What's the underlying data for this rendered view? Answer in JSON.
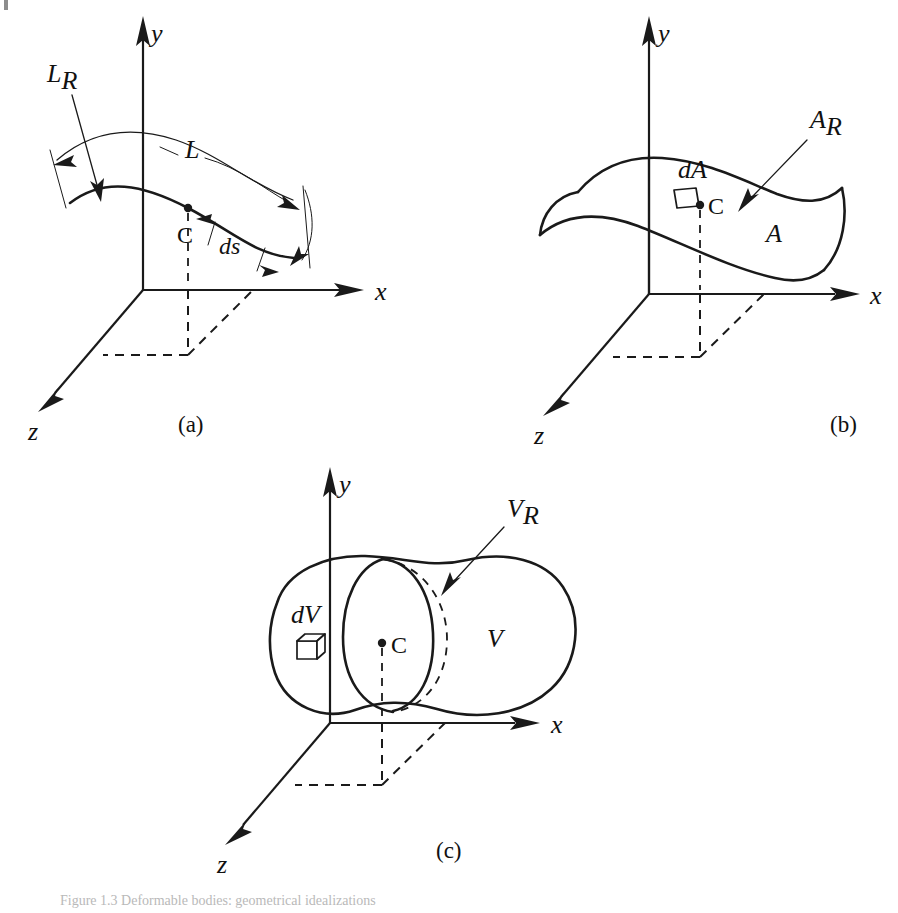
{
  "figure": {
    "panels": [
      {
        "id": "a",
        "caption": "(a)",
        "kind": "line",
        "axes": {
          "y": "y",
          "x": "x",
          "z": "z",
          "origin": "O"
        },
        "labels": {
          "reference_config": "L",
          "reference_sub": "R",
          "current_config": "L",
          "differential": "ds",
          "centroid": "C"
        }
      },
      {
        "id": "b",
        "caption": "(b)",
        "kind": "area",
        "axes": {
          "y": "y",
          "x": "x",
          "z": "z",
          "origin": "O"
        },
        "labels": {
          "reference_config": "A",
          "reference_sub": "R",
          "current_config": "A",
          "differential_d": "d",
          "differential_q": "A",
          "centroid": "C"
        }
      },
      {
        "id": "c",
        "caption": "(c)",
        "kind": "volume",
        "axes": {
          "y": "y",
          "x": "x",
          "z": "z",
          "origin": "O"
        },
        "labels": {
          "reference_config": "V",
          "reference_sub": "R",
          "current_config": "V",
          "differential_d": "d",
          "differential_q": "V",
          "centroid": "C"
        }
      }
    ],
    "figure_caption": "Figure 1.3   Deformable bodies: geometrical idealizations",
    "colors": {
      "ink": "#1a1a1a",
      "paper": "#ffffff"
    }
  }
}
